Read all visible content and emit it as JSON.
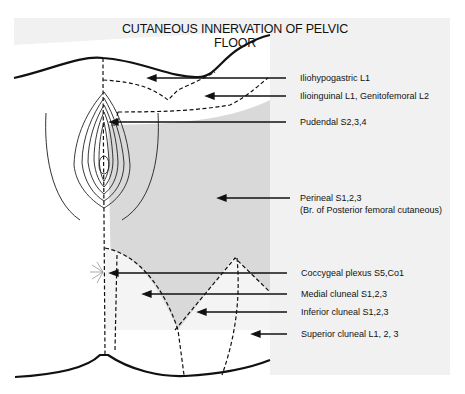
{
  "title": "CUTANEOUS INNERVATION OF PELVIC FLOOR",
  "labels": [
    {
      "id": "iliohypogastric",
      "text": "Iliohypogastric  L1"
    },
    {
      "id": "ilioinguinal",
      "text": "Ilioinguinal  L1, Genitofemoral  L2"
    },
    {
      "id": "pudendal",
      "text": "Pudendal  S2,3,4"
    },
    {
      "id": "perineal",
      "text": "Perineal S1,2,3"
    },
    {
      "id": "perineal_sub",
      "text": "(Br. of Posterior femoral cutaneous)"
    },
    {
      "id": "coccygeal",
      "text": "Coccygeal plexus  S5,Co1"
    },
    {
      "id": "medial_cluneal",
      "text": "Medial cluneal  S1,2,3"
    },
    {
      "id": "inferior_cluneal",
      "text": "Inferior cluneal  S1,2,3"
    },
    {
      "id": "superior_cluneal",
      "text": "Superior cluneal  L1, 2, 3"
    }
  ],
  "colors": {
    "panel": "#f1f1f1",
    "diagram_bg": "#ffffff",
    "shaded_region": "#d9d9d9",
    "ink": "#111111"
  }
}
